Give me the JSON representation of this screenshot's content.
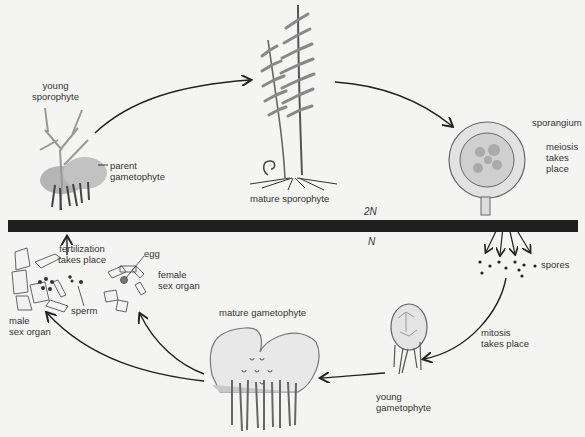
{
  "diagram": {
    "ploidy_bar": {
      "above": "2N",
      "below": "N"
    },
    "labels": {
      "young_sporophyte": "young\nsporophyte",
      "parent_gametophyte": "parent\ngametophyte",
      "mature_sporophyte": "mature sporophyte",
      "sporangium": "sporangium",
      "meiosis": "meiosis\ntakes\nplace",
      "spores": "spores",
      "mitosis": "mitosis\ntakes place",
      "young_gametophyte": "young\ngametophyte",
      "mature_gametophyte": "mature gametophyte",
      "fertilization": "fertilization\ntakes place",
      "egg": "egg",
      "female_sex_organ": "female\nsex organ",
      "sperm": "sperm",
      "male_sex_organ": "male\nsex organ"
    },
    "colors": {
      "background": "#f4f4f2",
      "bar": "#1f1f1f",
      "ink": "#2a2a2a",
      "fill": "#b8b8b8"
    }
  }
}
